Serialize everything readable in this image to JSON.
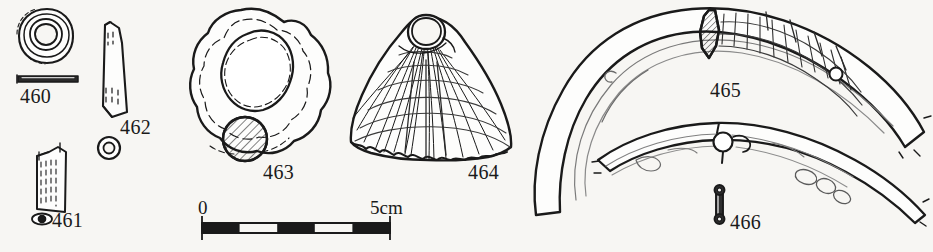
{
  "plate": {
    "kind": "archaeological-finds-illustration",
    "background_color": "#f7f6f3",
    "ink_color": "#1a1a1a",
    "width": 933,
    "height": 252
  },
  "figures": [
    {
      "id": "460",
      "label": "460",
      "name": "ring-bead",
      "description": "Annular ring bead, plan view with thin profile section below",
      "label_x": 20,
      "label_y": 86
    },
    {
      "id": "461",
      "label": "461",
      "name": "rectangular-bead-fragment",
      "description": "Rectangular bead or pendant fragment with oval cross-section symbol",
      "label_x": 52,
      "label_y": 218
    },
    {
      "id": "462",
      "label": "462",
      "name": "curved-bracelet-fragment",
      "description": "Elongated tapering bracelet fragment with circular cross-section below",
      "label_x": 120,
      "label_y": 120
    },
    {
      "id": "463",
      "label": "463",
      "name": "shell-ring",
      "description": "Irregular annular shell ring with hatched circular cross-section",
      "label_x": 263,
      "label_y": 166
    },
    {
      "id": "464",
      "label": "464",
      "name": "scallop-shell-pendant",
      "description": "Ribbed cockle or scallop shell pendant, perforated at the umbo",
      "label_x": 468,
      "label_y": 166
    },
    {
      "id": "465",
      "label": "465",
      "name": "shell-armlet-large",
      "description": "Large curved shell armlet with hatched wedge section and incised lattice decoration",
      "label_x": 710,
      "label_y": 82
    },
    {
      "id": "466",
      "label": "466",
      "name": "small-perforated-bead",
      "description": "Small elongated bead with two perforations",
      "label_x": 730,
      "label_y": 216
    }
  ],
  "scale_bar": {
    "name": "scale-bar",
    "start_label": "0",
    "end_label": "5cm",
    "start_label_x": 198,
    "start_label_y": 196,
    "end_label_x": 372,
    "end_label_y": 196,
    "x_start": 202,
    "x_end": 390,
    "y": 228,
    "divisions": 5,
    "units": "cm",
    "total_length_cm": 5
  }
}
